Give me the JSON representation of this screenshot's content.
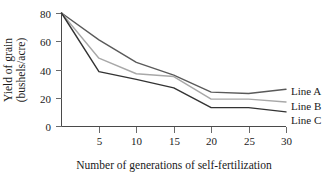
{
  "chart_data": {
    "type": "line",
    "title": "",
    "xlabel": "Number of generations of self-fertilization",
    "ylabel": "Yield of grain\n(bushels/acre)",
    "ylabel_line1": "Yield of grain",
    "ylabel_line2": "(bushels/acre)",
    "x": [
      0,
      5,
      10,
      15,
      20,
      25,
      30
    ],
    "xlim": [
      0,
      30
    ],
    "ylim": [
      0,
      80
    ],
    "xticks": [
      5,
      10,
      15,
      20,
      25,
      30
    ],
    "xtick_labels": [
      "5",
      "10",
      "15",
      "20",
      "25",
      "30"
    ],
    "yticks": [
      0,
      20,
      40,
      60,
      80
    ],
    "ytick_labels": [
      "0",
      "20",
      "40",
      "60",
      "80"
    ],
    "grid": false,
    "legend_position": "right",
    "series": [
      {
        "name": "Line A",
        "color": "#5a5a5a",
        "values": [
          80,
          61,
          45,
          36,
          24,
          23,
          26
        ]
      },
      {
        "name": "Line B",
        "color": "#a8a8a8",
        "values": [
          80,
          48,
          37,
          35,
          19,
          19,
          17
        ]
      },
      {
        "name": "Line C",
        "color": "#333333",
        "values": [
          80,
          38.5,
          33,
          27,
          13,
          13,
          10
        ]
      }
    ]
  },
  "legend": {
    "items": [
      {
        "label": "Line A"
      },
      {
        "label": "Line B"
      },
      {
        "label": "Line C"
      }
    ]
  }
}
